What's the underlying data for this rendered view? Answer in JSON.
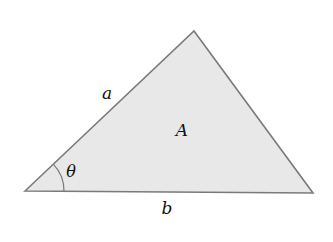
{
  "diagram": {
    "type": "triangle",
    "vertices": {
      "left": [
        25,
        191
      ],
      "top": [
        194,
        31
      ],
      "right": [
        313,
        193
      ]
    },
    "colors": {
      "fill": "#e8e8e8",
      "stroke": "#7a7a7a",
      "text": "#111111"
    },
    "labels": {
      "side_a": "a",
      "side_b": "b",
      "area": "A",
      "angle": "θ"
    }
  }
}
